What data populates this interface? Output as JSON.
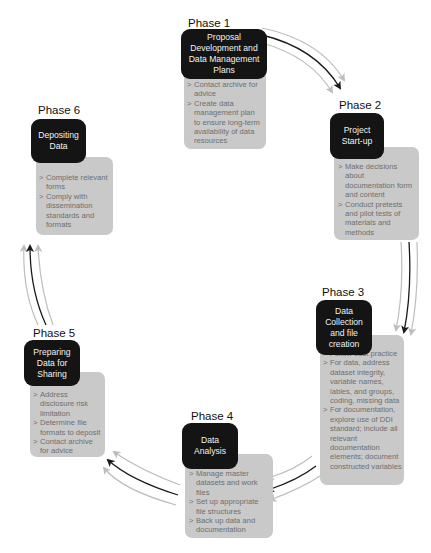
{
  "diagram": {
    "type": "cycle",
    "colors": {
      "title_box": "#141414",
      "title_text": "#f2f2f2",
      "detail_box": "#c9c9c9",
      "detail_text": "#6e6e6e",
      "arrow_dark": "#1a1a1a",
      "arrow_light": "#bdbdbd"
    },
    "phases": [
      {
        "label": "Phase 1",
        "title": "Proposal Development and Data Management Plans",
        "items": [
          "Contact archive for advice",
          "Create data management plan to ensure long-term availability of data resources"
        ]
      },
      {
        "label": "Phase 2",
        "title": "Project Start-up",
        "items": [
          "Make decisions about documentation form and content",
          "Conduct pretests and pilot tests of materials and methods"
        ]
      },
      {
        "label": "Phase 3",
        "title": "Data Collection and file creation",
        "items": [
          "Follow best practice",
          "For data, address dataset integrity, variable names, lables, and groups, coding, missing data",
          "For documentation, explore use of DDI standard; include all relevant documentation elements; document constructed variables"
        ]
      },
      {
        "label": "Phase 4",
        "title": "Data Analysis",
        "items": [
          "Manage master datasets and work files",
          "Set up appropriate file structures",
          "Back up data and documentation"
        ]
      },
      {
        "label": "Phase 5",
        "title": "Preparing Data for Sharing",
        "items": [
          "Address disclosure risk limitation",
          "Determine file formats to deposit",
          "Contact archive for advice"
        ]
      },
      {
        "label": "Phase 6",
        "title": "Depositing Data",
        "items": [
          "Complete relevant forms",
          "Comply with dissemination standards and formats"
        ]
      }
    ],
    "connections": [
      {
        "from": "Phase 1",
        "to": "Phase 2"
      },
      {
        "from": "Phase 2",
        "to": "Phase 3"
      },
      {
        "from": "Phase 3",
        "to": "Phase 4"
      },
      {
        "from": "Phase 4",
        "to": "Phase 5"
      },
      {
        "from": "Phase 5",
        "to": "Phase 6"
      }
    ]
  }
}
